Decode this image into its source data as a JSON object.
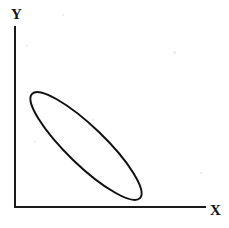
{
  "figure": {
    "background_color": "#ffffff",
    "ink_color": "#111111",
    "width": 229,
    "height": 228
  },
  "axes": {
    "x": {
      "label": "X",
      "line_start": [
        15,
        207
      ],
      "line_end": [
        205,
        207
      ],
      "label_position": [
        210,
        203
      ]
    },
    "y": {
      "label": "Y",
      "line_start": [
        15,
        27
      ],
      "line_end": [
        15,
        207
      ],
      "label_position": [
        11,
        7
      ]
    },
    "stroke_width": 2,
    "stroke_color": "#1a1a1a",
    "ticks": [],
    "gridlines": false
  },
  "chart_data": {
    "type": "scatter",
    "title": "",
    "xlabel": "X",
    "ylabel": "Y",
    "xlim": [
      0,
      100
    ],
    "ylim": [
      0,
      100
    ],
    "grid": false,
    "legend": "none",
    "annotations": [],
    "shapes": [
      {
        "kind": "ellipse",
        "role": "correlation-envelope",
        "center": [
          86,
          146
        ],
        "semi_major": 75,
        "semi_minor": 19,
        "rotation_deg": 44,
        "fill": "none",
        "stroke": "#111111",
        "stroke_width": 2,
        "description": "Narrow ellipse tilted down-to-the-right indicating strong negative correlation between X and Y"
      }
    ],
    "relationship": "negative",
    "points": []
  }
}
